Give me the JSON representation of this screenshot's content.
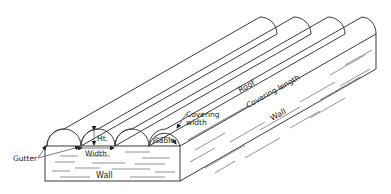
{
  "figure": {
    "type": "isometric line drawing",
    "bays": 4,
    "colors": {
      "line": "#3a3a3a",
      "background": "#ffffff",
      "text": "#222222"
    }
  },
  "labels": {
    "roof": "Roof",
    "covering_width_line1": "Covering",
    "covering_width_line2": "width",
    "covering_length": "Covering length",
    "wall_side": "Wall",
    "wall_front": "Wall",
    "gable": "Gable",
    "height": "Ht.",
    "width": "Width",
    "gutter": "Gutter"
  }
}
